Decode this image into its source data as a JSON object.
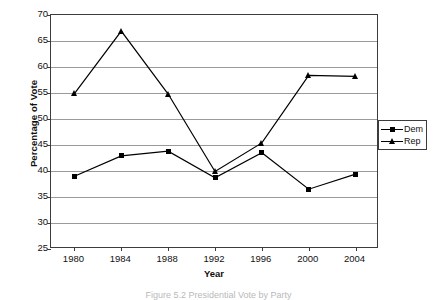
{
  "chart_data": {
    "type": "line",
    "title": "",
    "xlabel": "Year",
    "ylabel": "Percentage of Vote",
    "categories": [
      "1980",
      "1984",
      "1988",
      "1992",
      "1996",
      "2000",
      "2004"
    ],
    "x": [
      1980,
      1984,
      1988,
      1992,
      1996,
      2000,
      2004
    ],
    "ylim": [
      25,
      70
    ],
    "yticks": [
      25,
      30,
      35,
      40,
      45,
      50,
      55,
      60,
      65,
      70
    ],
    "ytick_labels": [
      "25",
      "30",
      "35",
      "40",
      "45",
      "50",
      "55",
      "60",
      "65",
      "70"
    ],
    "grid": "horizontal",
    "legend_position": "right-outside",
    "series": [
      {
        "name": "Dem",
        "marker": "square",
        "color": "#000000",
        "values": [
          39.0,
          42.9,
          43.8,
          38.7,
          43.5,
          36.5,
          39.4
        ]
      },
      {
        "name": "Rep",
        "marker": "triangle",
        "color": "#000000",
        "values": [
          54.9,
          66.9,
          54.8,
          39.9,
          45.4,
          58.4,
          58.2
        ]
      }
    ]
  },
  "legend": {
    "entries": [
      {
        "label": "Dem",
        "marker": "square"
      },
      {
        "label": "Rep",
        "marker": "triangle"
      }
    ]
  },
  "caption": {
    "text": "Figure 5.2   Presidential Vote by Party"
  }
}
